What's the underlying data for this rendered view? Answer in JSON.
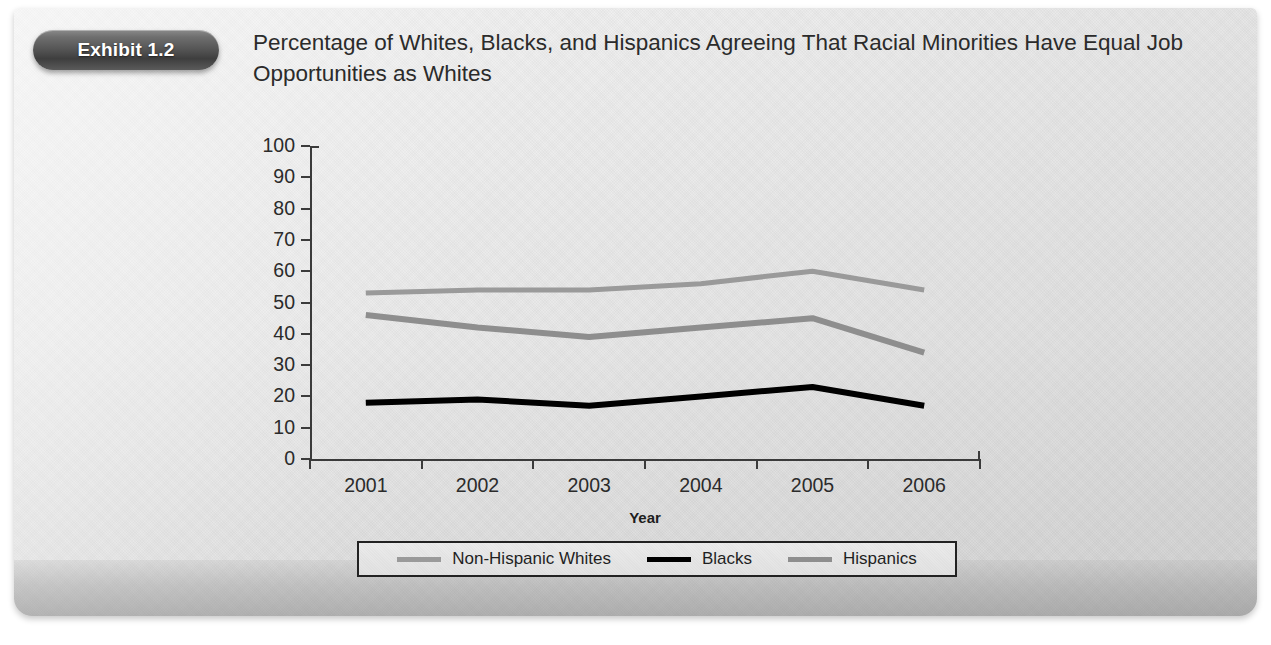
{
  "exhibit": {
    "badge_label": "Exhibit 1.2",
    "title": "Percentage of Whites, Blacks, and Hispanics Agreeing That Racial Minorities Have Equal Job Opportunities as Whites"
  },
  "colors": {
    "panel_background": "#e9e9e9",
    "badge_dark": "#3e3e3e",
    "axis": "#3b3b3b",
    "series_non_hispanic_whites": "#9a9a9a",
    "series_blacks": "#000000",
    "series_hispanics": "#8e8e8e",
    "legend_border": "#222222"
  },
  "chart_data": {
    "type": "line",
    "title": "Percentage of Whites, Blacks, and Hispanics Agreeing That Racial Minorities Have Equal Job Opportunities as Whites",
    "xlabel": "Year",
    "ylabel": "",
    "categories": [
      "2001",
      "2002",
      "2003",
      "2004",
      "2005",
      "2006"
    ],
    "ylim": [
      0,
      100
    ],
    "yticks": [
      0,
      10,
      20,
      30,
      40,
      50,
      60,
      70,
      80,
      90,
      100
    ],
    "grid": false,
    "legend_position": "bottom",
    "series": [
      {
        "name": "Non-Hispanic Whites",
        "color": "#9a9a9a",
        "width": 5,
        "values": [
          53,
          54,
          54,
          56,
          60,
          54
        ]
      },
      {
        "name": "Blacks",
        "color": "#000000",
        "width": 6,
        "values": [
          18,
          19,
          17,
          20,
          23,
          17
        ]
      },
      {
        "name": "Hispanics",
        "color": "#8e8e8e",
        "width": 6,
        "values": [
          46,
          42,
          39,
          42,
          45,
          34
        ]
      }
    ]
  },
  "legend": {
    "items": [
      {
        "label": "Non-Hispanic Whites",
        "color": "#9a9a9a"
      },
      {
        "label": "Blacks",
        "color": "#000000"
      },
      {
        "label": "Hispanics",
        "color": "#8e8e8e"
      }
    ]
  }
}
